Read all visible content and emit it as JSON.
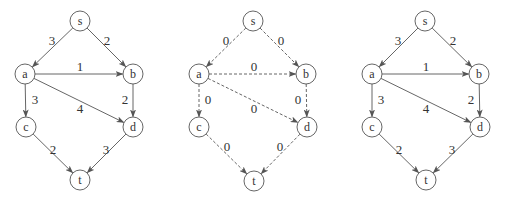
{
  "colors": {
    "line": "#555555",
    "text": "#333333",
    "background": "#ffffff"
  },
  "graphs": [
    {
      "id": "left",
      "style": "solid",
      "nodes": [
        {
          "id": "s",
          "label": "s",
          "x": 80,
          "y": 21
        },
        {
          "id": "a",
          "label": "a",
          "x": 25,
          "y": 74
        },
        {
          "id": "b",
          "label": "b",
          "x": 133,
          "y": 74
        },
        {
          "id": "c",
          "label": "c",
          "x": 26,
          "y": 127
        },
        {
          "id": "d",
          "label": "d",
          "x": 133,
          "y": 127
        },
        {
          "id": "t",
          "label": "t",
          "x": 80,
          "y": 180
        }
      ],
      "edges": [
        {
          "from": "s",
          "to": "a",
          "label": "3",
          "lx": 52,
          "ly": 40
        },
        {
          "from": "s",
          "to": "b",
          "label": "2",
          "lx": 107,
          "ly": 40
        },
        {
          "from": "a",
          "to": "b",
          "label": "1",
          "lx": 80,
          "ly": 66
        },
        {
          "from": "a",
          "to": "c",
          "label": "3",
          "lx": 35,
          "ly": 99
        },
        {
          "from": "a",
          "to": "d",
          "label": "4",
          "lx": 80,
          "ly": 108
        },
        {
          "from": "b",
          "to": "d",
          "label": "2",
          "lx": 125,
          "ly": 99
        },
        {
          "from": "c",
          "to": "t",
          "label": "2",
          "lx": 53,
          "ly": 149
        },
        {
          "from": "d",
          "to": "t",
          "label": "3",
          "lx": 106,
          "ly": 149
        }
      ]
    },
    {
      "id": "middle",
      "style": "dashed",
      "nodes": [
        {
          "id": "s",
          "label": "s",
          "x": 253,
          "y": 21
        },
        {
          "id": "a",
          "label": "a",
          "x": 199,
          "y": 74
        },
        {
          "id": "b",
          "label": "b",
          "x": 306,
          "y": 74
        },
        {
          "id": "c",
          "label": "c",
          "x": 199,
          "y": 127
        },
        {
          "id": "d",
          "label": "d",
          "x": 307,
          "y": 127
        },
        {
          "id": "t",
          "label": "t",
          "x": 254,
          "y": 181
        }
      ],
      "edges": [
        {
          "from": "s",
          "to": "a",
          "label": "0",
          "lx": 226,
          "ly": 40
        },
        {
          "from": "s",
          "to": "b",
          "label": "0",
          "lx": 281,
          "ly": 40
        },
        {
          "from": "a",
          "to": "b",
          "label": "0",
          "lx": 254,
          "ly": 66
        },
        {
          "from": "a",
          "to": "c",
          "label": "0",
          "lx": 208,
          "ly": 99
        },
        {
          "from": "a",
          "to": "d",
          "label": "0",
          "lx": 254,
          "ly": 108
        },
        {
          "from": "b",
          "to": "d",
          "label": "0",
          "lx": 298,
          "ly": 99
        },
        {
          "from": "c",
          "to": "t",
          "label": "0",
          "lx": 227,
          "ly": 146
        },
        {
          "from": "d",
          "to": "t",
          "label": "0",
          "lx": 280,
          "ly": 146
        }
      ]
    },
    {
      "id": "right",
      "style": "solid",
      "nodes": [
        {
          "id": "s",
          "label": "s",
          "x": 425,
          "y": 21
        },
        {
          "id": "a",
          "label": "a",
          "x": 372,
          "y": 74
        },
        {
          "id": "b",
          "label": "b",
          "x": 479,
          "y": 74
        },
        {
          "id": "c",
          "label": "c",
          "x": 372,
          "y": 127
        },
        {
          "id": "d",
          "label": "d",
          "x": 480,
          "y": 127
        },
        {
          "id": "t",
          "label": "t",
          "x": 426,
          "y": 180
        }
      ],
      "edges": [
        {
          "from": "s",
          "to": "a",
          "label": "3",
          "lx": 398,
          "ly": 40
        },
        {
          "from": "s",
          "to": "b",
          "label": "2",
          "lx": 453,
          "ly": 40
        },
        {
          "from": "a",
          "to": "b",
          "label": "1",
          "lx": 426,
          "ly": 66
        },
        {
          "from": "a",
          "to": "c",
          "label": "3",
          "lx": 381,
          "ly": 99
        },
        {
          "from": "a",
          "to": "d",
          "label": "4",
          "lx": 426,
          "ly": 108
        },
        {
          "from": "b",
          "to": "d",
          "label": "2",
          "lx": 471,
          "ly": 99
        },
        {
          "from": "c",
          "to": "t",
          "label": "2",
          "lx": 399,
          "ly": 149
        },
        {
          "from": "d",
          "to": "t",
          "label": "3",
          "lx": 452,
          "ly": 149
        }
      ]
    }
  ],
  "node_radius": 10
}
